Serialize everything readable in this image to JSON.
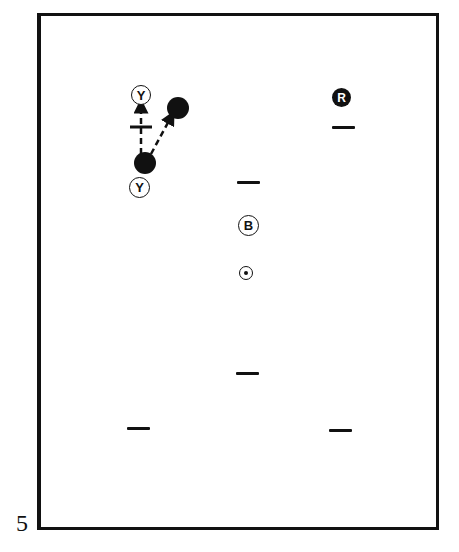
{
  "page_number": "5",
  "markers": {
    "top_left_label": "Y",
    "bottom_left_label": "Y",
    "center_label": "B",
    "top_right_label": "R"
  },
  "colors": {
    "ink": "#111111",
    "background": "#ffffff"
  }
}
